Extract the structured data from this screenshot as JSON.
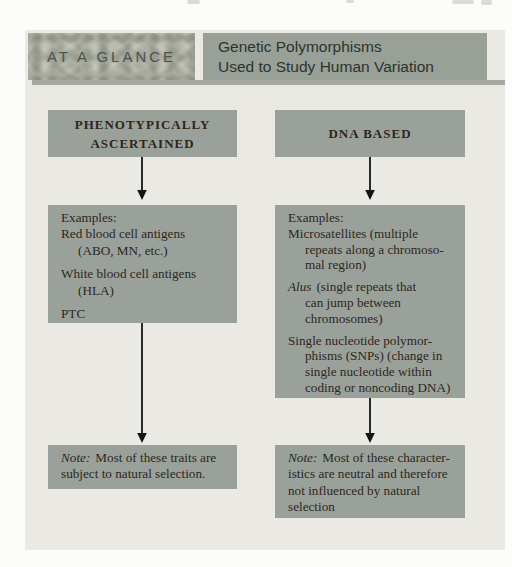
{
  "header": {
    "kicker": "AT A GLANCE",
    "title_line1": "Genetic Polymorphisms",
    "title_line2": "Used to Study Human Variation"
  },
  "columns": {
    "left": {
      "heading_line1": "PHENOTYPICALLY",
      "heading_line2": "ASCERTAINED",
      "examples": {
        "label": "Examples:",
        "item1_line1": "Red blood cell antigens",
        "item1_line2": "(ABO, MN, etc.)",
        "item2_line1": "White blood cell antigens",
        "item2_line2": "(HLA)",
        "item3": "PTC"
      },
      "note": {
        "lead": "Note:",
        "line1": "Most of these traits are",
        "line2": "subject to natural selection."
      }
    },
    "right": {
      "heading_line1": "DNA BASED",
      "examples": {
        "label": "Examples:",
        "item1_line1": "Microsatellites (multiple",
        "item1_line2": "repeats along a chromoso-",
        "item1_line3": "mal region)",
        "item2_lead": "Alus",
        "item2_line1": "(single repeats that",
        "item2_line2": "can jump between",
        "item2_line3": "chromosomes)",
        "item3_line1": "Single nucleotide polymor-",
        "item3_line2": "phisms (SNPs) (change in",
        "item3_line3": "single nucleotide within",
        "item3_line4": "coding or noncoding DNA)"
      },
      "note": {
        "lead": "Note:",
        "line1": "Most of these character-",
        "line2": "istics are neutral and therefore",
        "line3": "not influenced by natural",
        "line4": "selection"
      }
    }
  },
  "colors": {
    "page_background": "#fcfcfb",
    "diagram_background": "#eae9e3",
    "box_fill": "#9aa19a",
    "title_box_fill": "#98a098",
    "kicker_box_fill": "#a8ab9f",
    "header_shadow": "#a7a9a1",
    "text_dark": "#2e2620",
    "arrow": "#141414"
  }
}
